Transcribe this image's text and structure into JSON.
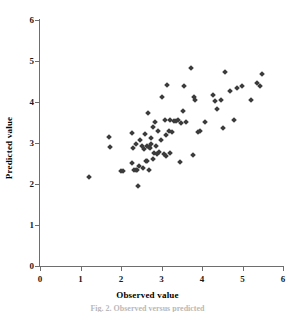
{
  "figure": {
    "caption": "Fig. 2. Observed versus predicted",
    "marker_color": "#3b3b3b",
    "axis_color": "#6e6e6e",
    "background": "#ffffff"
  },
  "chart_data": {
    "type": "scatter",
    "title": "",
    "xlabel": "Observed value",
    "ylabel": "Predicted value",
    "xlim": [
      0,
      6
    ],
    "ylim": [
      0,
      6
    ],
    "xticks": [
      0,
      1,
      2,
      3,
      4,
      5,
      6
    ],
    "yticks": [
      0,
      1,
      2,
      3,
      4,
      5,
      6
    ],
    "xticklabels": [
      "0",
      "1",
      "2",
      "3",
      "4",
      "5",
      "6"
    ],
    "yticklabels": [
      "0",
      "1",
      "2",
      "3",
      "4",
      "5",
      "6"
    ],
    "grid": false,
    "legend": null,
    "marker": "diamond",
    "series": [
      {
        "name": "observations",
        "points": [
          [
            1.21,
            2.18
          ],
          [
            1.7,
            3.14
          ],
          [
            1.74,
            2.91
          ],
          [
            2.01,
            2.31
          ],
          [
            2.05,
            2.32
          ],
          [
            2.26,
            3.24
          ],
          [
            2.28,
            2.52
          ],
          [
            2.3,
            2.87
          ],
          [
            2.32,
            2.33
          ],
          [
            2.36,
            2.34
          ],
          [
            2.38,
            2.98
          ],
          [
            2.4,
            2.33
          ],
          [
            2.43,
            1.96
          ],
          [
            2.45,
            2.45
          ],
          [
            2.48,
            3.07
          ],
          [
            2.52,
            2.92
          ],
          [
            2.55,
            2.4
          ],
          [
            2.57,
            2.86
          ],
          [
            2.6,
            3.22
          ],
          [
            2.62,
            2.55
          ],
          [
            2.64,
            2.93
          ],
          [
            2.65,
            2.56
          ],
          [
            2.67,
            3.73
          ],
          [
            2.68,
            2.9
          ],
          [
            2.7,
            2.33
          ],
          [
            2.71,
            2.88
          ],
          [
            2.73,
            2.97
          ],
          [
            2.75,
            3.13
          ],
          [
            2.78,
            2.6
          ],
          [
            2.8,
            3.38
          ],
          [
            2.82,
            2.75
          ],
          [
            2.85,
            3.52
          ],
          [
            2.87,
            2.93
          ],
          [
            2.9,
            2.72
          ],
          [
            2.92,
            3.3
          ],
          [
            2.95,
            2.78
          ],
          [
            2.98,
            3.08
          ],
          [
            3.02,
            4.13
          ],
          [
            3.05,
            2.72
          ],
          [
            3.08,
            3.56
          ],
          [
            3.1,
            2.69
          ],
          [
            3.12,
            3.2
          ],
          [
            3.14,
            4.41
          ],
          [
            3.18,
            3.3
          ],
          [
            3.2,
            3.55
          ],
          [
            3.22,
            2.76
          ],
          [
            3.25,
            3.28
          ],
          [
            3.3,
            3.54
          ],
          [
            3.36,
            3.54
          ],
          [
            3.4,
            3.56
          ],
          [
            3.45,
            2.53
          ],
          [
            3.48,
            3.48
          ],
          [
            3.52,
            3.78
          ],
          [
            3.56,
            4.4
          ],
          [
            3.6,
            3.52
          ],
          [
            3.72,
            4.82
          ],
          [
            3.78,
            2.71
          ],
          [
            3.8,
            4.12
          ],
          [
            3.82,
            4.06
          ],
          [
            3.9,
            3.27
          ],
          [
            3.96,
            3.3
          ],
          [
            4.08,
            3.52
          ],
          [
            4.28,
            4.18
          ],
          [
            4.32,
            4.03
          ],
          [
            4.38,
            3.84
          ],
          [
            4.46,
            4.06
          ],
          [
            4.52,
            3.37
          ],
          [
            4.56,
            4.74
          ],
          [
            4.7,
            4.28
          ],
          [
            4.8,
            3.56
          ],
          [
            4.86,
            4.33
          ],
          [
            4.98,
            4.4
          ],
          [
            5.22,
            4.05
          ],
          [
            5.36,
            4.47
          ],
          [
            5.44,
            4.4
          ],
          [
            5.48,
            4.69
          ]
        ]
      }
    ]
  }
}
